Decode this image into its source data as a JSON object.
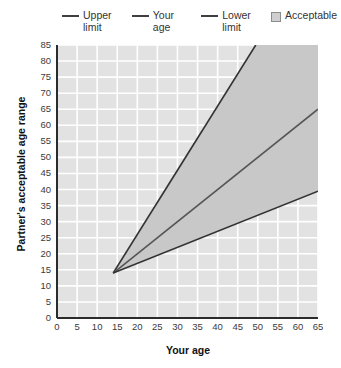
{
  "chart_data": {
    "type": "line",
    "title": "",
    "xlabel": "Your age",
    "ylabel": "Partner's acceptable age range",
    "xlim": [
      0,
      65
    ],
    "ylim": [
      0,
      85
    ],
    "xticks": [
      0,
      5,
      10,
      15,
      20,
      25,
      30,
      35,
      40,
      45,
      50,
      55,
      60,
      65
    ],
    "yticks": [
      0,
      5,
      10,
      15,
      20,
      25,
      30,
      35,
      40,
      45,
      50,
      55,
      60,
      65,
      70,
      75,
      80,
      85
    ],
    "grid": true,
    "legend_position": "top",
    "series": [
      {
        "name": "Upper limit",
        "color": "#333333",
        "x": [
          14,
          49.5
        ],
        "values": [
          14,
          85
        ]
      },
      {
        "name": "Your age",
        "color": "#555555",
        "x": [
          14,
          65
        ],
        "values": [
          14,
          65
        ]
      },
      {
        "name": "Lower limit",
        "color": "#333333",
        "x": [
          14,
          65
        ],
        "values": [
          14,
          39.5
        ]
      }
    ],
    "shaded_region": {
      "name": "Acceptable",
      "color": "#c8c8c8",
      "description": "Region between the lower limit and the upper limit lines",
      "polygon_x": [
        14,
        49.5,
        65,
        65
      ],
      "polygon_y": [
        14,
        85,
        85,
        39.5
      ]
    }
  },
  "legend": {
    "items": [
      {
        "label": "Upper limit",
        "marker": "line",
        "color": "#3f3f3f"
      },
      {
        "label": "Your age",
        "marker": "line",
        "color": "#3f3f3f"
      },
      {
        "label": "Lower limit",
        "marker": "line",
        "color": "#3f3f3f"
      },
      {
        "label": "Acceptable",
        "marker": "swatch",
        "color": "#cfcfcf"
      }
    ]
  },
  "colors": {
    "plot_background": "#e2e2e2",
    "grid": "#ffffff",
    "axis": "#2b2b2b",
    "shade": "#c8c8c8",
    "line": "#333333"
  }
}
